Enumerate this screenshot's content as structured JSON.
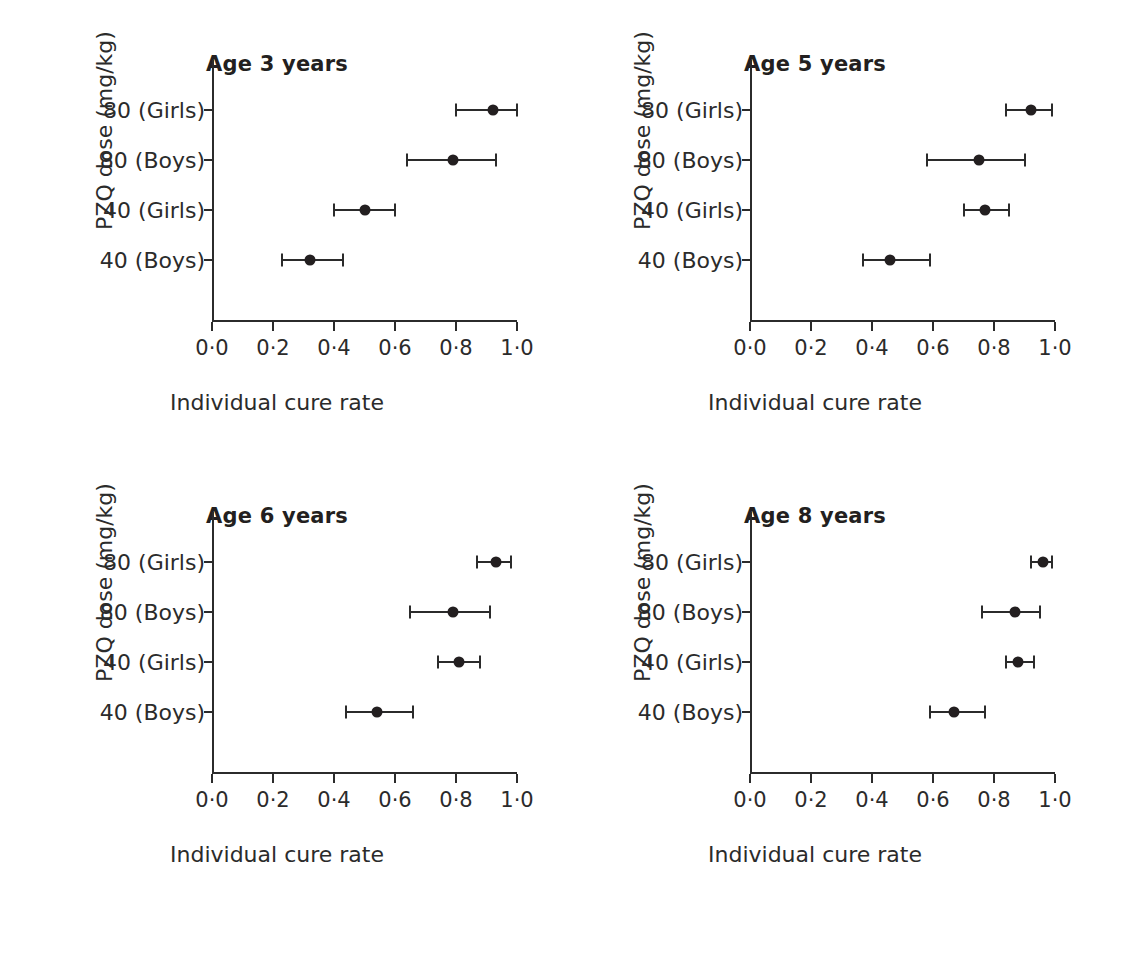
{
  "figure": {
    "background": "#ffffff",
    "ink_color": "#2b2b2b",
    "marker_color": "#231f20"
  },
  "chart_data": {
    "type": "scatter",
    "subtype": "forest-plot-dot-and-whisker",
    "title": "",
    "xlabel": "Individual cure rate",
    "ylabel": "PZQ dose (mg/kg)",
    "xlim": [
      0.0,
      1.0
    ],
    "xticks": [
      0.0,
      0.2,
      0.4,
      0.6,
      0.8,
      1.0
    ],
    "xtick_labels": [
      "0·0",
      "0·2",
      "0·4",
      "0·6",
      "0·8",
      "1·0"
    ],
    "categories": [
      "80 (Girls)",
      "80 (Boys)",
      "40 (Girls)",
      "40 (Boys)"
    ],
    "grid": false,
    "legend": false,
    "error_bars": "horizontal 95% credible interval",
    "panels": [
      {
        "title": "Age 3 years",
        "xlabel": "Individual cure rate",
        "ylabel": "PZQ dose (mg/kg)",
        "points": [
          {
            "category": "80 (Girls)",
            "value": 0.92,
            "low": 0.8,
            "high": 1.0
          },
          {
            "category": "80 (Boys)",
            "value": 0.79,
            "low": 0.64,
            "high": 0.93
          },
          {
            "category": "40 (Girls)",
            "value": 0.5,
            "low": 0.4,
            "high": 0.6
          },
          {
            "category": "40 (Boys)",
            "value": 0.32,
            "low": 0.23,
            "high": 0.43
          }
        ]
      },
      {
        "title": "Age 5 years",
        "xlabel": "Individual cure rate",
        "ylabel": "PZQ dose (mg/kg)",
        "points": [
          {
            "category": "80 (Girls)",
            "value": 0.92,
            "low": 0.84,
            "high": 0.99
          },
          {
            "category": "80 (Boys)",
            "value": 0.75,
            "low": 0.58,
            "high": 0.9
          },
          {
            "category": "40 (Girls)",
            "value": 0.77,
            "low": 0.7,
            "high": 0.85
          },
          {
            "category": "40 (Boys)",
            "value": 0.46,
            "low": 0.37,
            "high": 0.59
          }
        ]
      },
      {
        "title": "Age 6 years",
        "xlabel": "Individual cure rate",
        "ylabel": "PZQ dose (mg/kg)",
        "points": [
          {
            "category": "80 (Girls)",
            "value": 0.93,
            "low": 0.87,
            "high": 0.98
          },
          {
            "category": "80 (Boys)",
            "value": 0.79,
            "low": 0.65,
            "high": 0.91
          },
          {
            "category": "40 (Girls)",
            "value": 0.81,
            "low": 0.74,
            "high": 0.88
          },
          {
            "category": "40 (Boys)",
            "value": 0.54,
            "low": 0.44,
            "high": 0.66
          }
        ]
      },
      {
        "title": "Age 8 years",
        "xlabel": "Individual cure rate",
        "ylabel": "PZQ dose (mg/kg)",
        "points": [
          {
            "category": "80 (Girls)",
            "value": 0.96,
            "low": 0.92,
            "high": 0.99
          },
          {
            "category": "80 (Boys)",
            "value": 0.87,
            "low": 0.76,
            "high": 0.95
          },
          {
            "category": "40 (Girls)",
            "value": 0.88,
            "low": 0.84,
            "high": 0.93
          },
          {
            "category": "40 (Boys)",
            "value": 0.67,
            "low": 0.59,
            "high": 0.77
          }
        ]
      }
    ]
  }
}
